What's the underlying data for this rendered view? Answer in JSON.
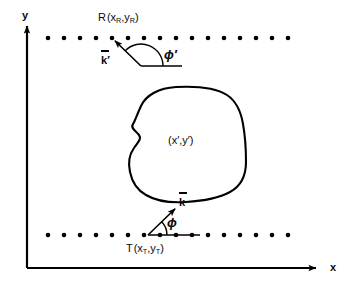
{
  "figure": {
    "type": "scattering-geometry-diagram",
    "background": "#ffffff",
    "ink": "#000000",
    "width": 344,
    "height": 286,
    "axes": {
      "x_label": "x",
      "y_label": "y",
      "origin": [
        27,
        268
      ],
      "x_end": [
        322,
        268
      ],
      "y_end": [
        27,
        22
      ]
    },
    "labels": {
      "receiver": {
        "name": "R",
        "open": "(",
        "x_sym": "x",
        "x_sub": "R",
        "comma": ",",
        "y_sym": "y",
        "y_sub": "R",
        "close": ")"
      },
      "transmitter": {
        "name": "T",
        "open": "(",
        "x_sym": "x",
        "x_sub": "T",
        "comma": ",",
        "y_sym": "y",
        "y_sub": "T",
        "close": ")"
      },
      "scatterer": {
        "open": "(",
        "x_sym": "x",
        "x_prime": "′",
        "comma": ",",
        "y_sym": "y",
        "y_prime": "′",
        "close": ")"
      },
      "k_incident": "k",
      "k_incident_overbar": "̅",
      "k_scattered": "k",
      "k_scattered_prime": "′",
      "phi_incident": "ϕ",
      "phi_scattered": "ϕ",
      "phi_scattered_prime": "′"
    },
    "dotted_rows": [
      {
        "name": "upper-interface",
        "y": 38,
        "x_start": 48,
        "x_end": 288,
        "spacing": 16,
        "dot_radius": 2.3,
        "count": 16
      },
      {
        "name": "lower-interface",
        "y": 235,
        "x_start": 48,
        "x_end": 288,
        "spacing": 16,
        "dot_radius": 2.3,
        "count": 16
      }
    ],
    "points": {
      "R": [
        112,
        38
      ],
      "T": [
        148,
        235
      ]
    },
    "vectors": {
      "k_incident": {
        "from": [
          148,
          235
        ],
        "to": [
          178,
          206
        ]
      },
      "k_scattered": {
        "from": [
          141,
          66
        ],
        "to": [
          112,
          38
        ]
      }
    },
    "angles": {
      "phi": {
        "vertex": [
          148,
          235
        ],
        "radius": 19,
        "baseline_to": [
          200,
          235
        ]
      },
      "phi_prime": {
        "vertex": [
          141,
          66
        ],
        "radius": 22,
        "baseline_to": [
          182,
          66
        ]
      }
    },
    "blob": {
      "name": "scattering-body",
      "stroke_width": 2.1,
      "path": "M 176 87 C 159 88 146 95 141 106 C 136 117 135 121 133 124 C 130 128 136 131 139 135 C 142 139 138 142 134 148 C 129 155 128 163 130 172 C 132 182 137 190 146 195 C 156 201 170 203 186 202 C 203 201 219 198 230 192 C 241 186 246 176 246 162 C 246 148 245 135 243 124 C 241 112 236 101 227 95 C 216 88 195 86 176 87 Z"
    }
  }
}
